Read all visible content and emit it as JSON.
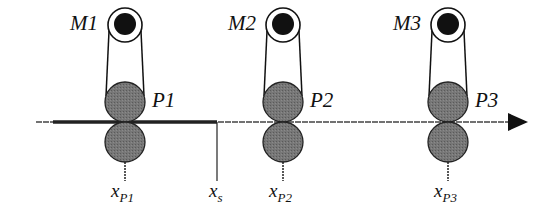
{
  "diagram": {
    "type": "multi-roller web transport schematic",
    "colors": {
      "roller_fill": "#6e6e6e",
      "line": "#111111",
      "background": "#ffffff"
    },
    "units": [
      {
        "motor": "M1",
        "roller": "P1",
        "position_label": "x",
        "position_sub": "P1"
      },
      {
        "motor": "M2",
        "roller": "P2",
        "position_label": "x",
        "position_sub": "P2"
      },
      {
        "motor": "M3",
        "roller": "P3",
        "position_label": "x",
        "position_sub": "P3"
      }
    ],
    "splice_label": "x",
    "splice_sub": "s",
    "direction": "left-to-right arrow"
  }
}
